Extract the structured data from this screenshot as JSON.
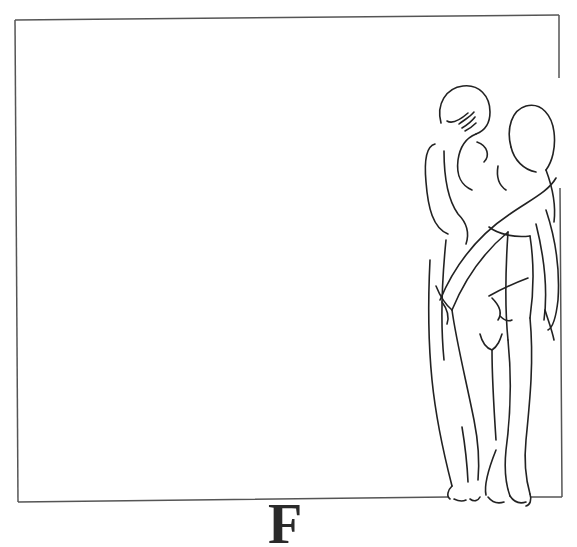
{
  "illustration": {
    "letter": "F",
    "description": "Line drawing of two standing nude figures overlapping the right edge of a rectangular frame",
    "colors": {
      "background": "#ffffff",
      "frame_stroke": "#555555",
      "figure_stroke": "#222222",
      "letter": "#2a2a2a"
    },
    "frame": {
      "corners": [
        [
          15,
          20
        ],
        [
          559,
          15
        ],
        [
          562,
          497
        ],
        [
          18,
          502
        ]
      ]
    }
  }
}
